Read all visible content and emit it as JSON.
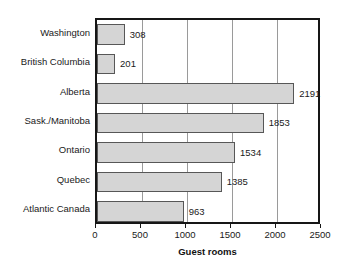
{
  "chart_data": {
    "type": "bar",
    "orientation": "horizontal",
    "title": "",
    "xlabel": "Guest rooms",
    "ylabel": "",
    "categories": [
      "Washington",
      "British Columbia",
      "Alberta",
      "Sask./Manitoba",
      "Ontario",
      "Quebec",
      "Atlantic Canada"
    ],
    "values": [
      308,
      201,
      2191,
      1853,
      1534,
      1385,
      963
    ],
    "data_labels": [
      "308",
      "201",
      "2191",
      "1853",
      "1534",
      "1385",
      "963"
    ],
    "xlim": [
      0,
      2500
    ],
    "xticks": [
      0,
      500,
      1000,
      1500,
      2000,
      2500
    ],
    "xtick_labels": [
      "0",
      "500",
      "1000",
      "1500",
      "2000",
      "2500"
    ],
    "gridlines": [
      500,
      1000,
      1500,
      2000
    ],
    "grid": true,
    "legend": null,
    "colors": {
      "bar_fill": "#d5d5d5",
      "bar_stroke": "#575757",
      "frame": "#161616",
      "gridline": "#9a9a9a",
      "text": "#1a1a1a",
      "background": "#ffffff"
    }
  }
}
